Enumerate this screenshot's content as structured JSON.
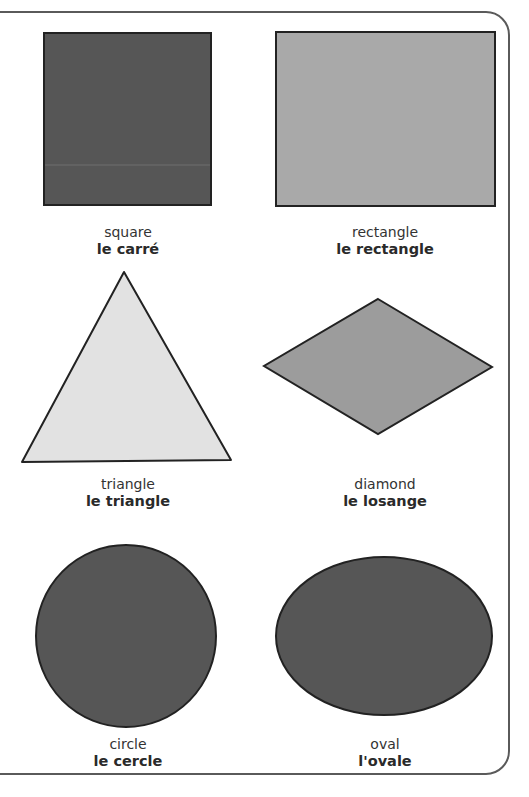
{
  "colors": {
    "frame_border": "#5a5a5a",
    "shape_outline": "#222222",
    "dark_fill": "#565656",
    "rectangle_fill": "#a9a9a9",
    "diamond_fill": "#9c9c9c",
    "triangle_fill": "#e2e2e2"
  },
  "shapes": [
    {
      "id": "square",
      "english": "square",
      "french": "le carré"
    },
    {
      "id": "rectangle",
      "english": "rectangle",
      "french": "le rectangle"
    },
    {
      "id": "triangle",
      "english": "triangle",
      "french": "le triangle"
    },
    {
      "id": "diamond",
      "english": "diamond",
      "french": "le losange"
    },
    {
      "id": "circle",
      "english": "circle",
      "french": "le cercle"
    },
    {
      "id": "oval",
      "english": "oval",
      "french": "l'ovale"
    }
  ]
}
